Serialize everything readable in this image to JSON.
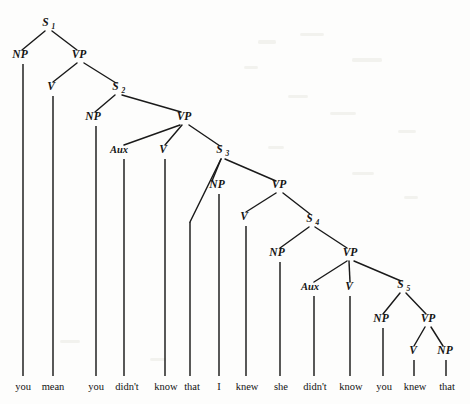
{
  "diagram": {
    "kind": "syntax-tree",
    "sentence": "you mean you didn't know that I knew she didn't know you knew that",
    "background_color": "#fdfdfc",
    "ink_color": "#1a1a1a",
    "width": 470,
    "height": 404
  },
  "nodes": [
    {
      "id": "S1",
      "label": "S",
      "sub": "1",
      "x": 48,
      "y": 26,
      "kind": "clause"
    },
    {
      "id": "NP1",
      "label": "NP",
      "sub": "",
      "x": 20,
      "y": 58,
      "kind": "phrase"
    },
    {
      "id": "VP1",
      "label": "VP",
      "sub": "",
      "x": 79,
      "y": 58,
      "kind": "phrase"
    },
    {
      "id": "V1",
      "label": "V",
      "sub": "",
      "x": 51,
      "y": 90,
      "kind": "head"
    },
    {
      "id": "S2",
      "label": "S",
      "sub": "2",
      "x": 118,
      "y": 90,
      "kind": "clause"
    },
    {
      "id": "NP2",
      "label": "NP",
      "sub": "",
      "x": 93,
      "y": 120,
      "kind": "phrase"
    },
    {
      "id": "VP2",
      "label": "VP",
      "sub": "",
      "x": 184,
      "y": 120,
      "kind": "phrase"
    },
    {
      "id": "AUX1",
      "label": "Aux",
      "sub": "",
      "x": 119,
      "y": 153,
      "kind": "aux"
    },
    {
      "id": "V2",
      "label": "V",
      "sub": "",
      "x": 163,
      "y": 153,
      "kind": "head"
    },
    {
      "id": "S3",
      "label": "S",
      "sub": "3",
      "x": 222,
      "y": 153,
      "kind": "clause"
    },
    {
      "id": "NP3",
      "label": "NP",
      "sub": "",
      "x": 217,
      "y": 188,
      "kind": "phrase"
    },
    {
      "id": "VP3",
      "label": "VP",
      "sub": "",
      "x": 279,
      "y": 188,
      "kind": "phrase"
    },
    {
      "id": "V3",
      "label": "V",
      "sub": "",
      "x": 244,
      "y": 220,
      "kind": "head"
    },
    {
      "id": "S4",
      "label": "S",
      "sub": "4",
      "x": 312,
      "y": 222,
      "kind": "clause"
    },
    {
      "id": "NP4",
      "label": "NP",
      "sub": "",
      "x": 277,
      "y": 256,
      "kind": "phrase"
    },
    {
      "id": "VP4",
      "label": "VP",
      "sub": "",
      "x": 350,
      "y": 256,
      "kind": "phrase"
    },
    {
      "id": "AUX2",
      "label": "Aux",
      "sub": "",
      "x": 310,
      "y": 290,
      "kind": "aux"
    },
    {
      "id": "V4",
      "label": "V",
      "sub": "",
      "x": 349,
      "y": 290,
      "kind": "head"
    },
    {
      "id": "S5",
      "label": "S",
      "sub": "5",
      "x": 403,
      "y": 288,
      "kind": "clause"
    },
    {
      "id": "NP5",
      "label": "NP",
      "sub": "",
      "x": 381,
      "y": 322,
      "kind": "phrase"
    },
    {
      "id": "VP5",
      "label": "VP",
      "sub": "",
      "x": 428,
      "y": 322,
      "kind": "phrase"
    },
    {
      "id": "V5",
      "label": "V",
      "sub": "",
      "x": 413,
      "y": 354,
      "kind": "head"
    },
    {
      "id": "NP6",
      "label": "NP",
      "sub": "",
      "x": 445,
      "y": 354,
      "kind": "phrase"
    }
  ],
  "branches": [
    {
      "from": "S1",
      "to": "NP1",
      "x1": 45,
      "y1": 31,
      "x2": 22,
      "y2": 50
    },
    {
      "from": "S1",
      "to": "VP1",
      "x1": 52,
      "y1": 31,
      "x2": 77,
      "y2": 50
    },
    {
      "from": "VP1",
      "to": "V1",
      "x1": 77,
      "y1": 63,
      "x2": 53,
      "y2": 82
    },
    {
      "from": "VP1",
      "to": "S2",
      "x1": 84,
      "y1": 63,
      "x2": 116,
      "y2": 83
    },
    {
      "from": "S2",
      "to": "NP2",
      "x1": 115,
      "y1": 95,
      "x2": 95,
      "y2": 112
    },
    {
      "from": "S2",
      "to": "VP2",
      "x1": 122,
      "y1": 95,
      "x2": 181,
      "y2": 112
    },
    {
      "from": "VP2",
      "to": "AUX1",
      "x1": 180,
      "y1": 125,
      "x2": 124,
      "y2": 145
    },
    {
      "from": "VP2",
      "to": "V2",
      "x1": 182,
      "y1": 125,
      "x2": 165,
      "y2": 145
    },
    {
      "from": "VP2",
      "to": "S3",
      "x1": 189,
      "y1": 125,
      "x2": 220,
      "y2": 146
    },
    {
      "from": "S3",
      "to": "COMP",
      "x1": 221,
      "y1": 159,
      "x2": 190,
      "y2": 222
    },
    {
      "from": "S3",
      "to": "NP3",
      "x1": 221,
      "y1": 159,
      "x2": 212,
      "y2": 181
    },
    {
      "from": "S3",
      "to": "VP3",
      "x1": 225,
      "y1": 159,
      "x2": 276,
      "y2": 181
    },
    {
      "from": "VP3",
      "to": "V3",
      "x1": 276,
      "y1": 193,
      "x2": 246,
      "y2": 212
    },
    {
      "from": "VP3",
      "to": "S4",
      "x1": 283,
      "y1": 193,
      "x2": 310,
      "y2": 214
    },
    {
      "from": "S4",
      "to": "NP4",
      "x1": 309,
      "y1": 227,
      "x2": 280,
      "y2": 248
    },
    {
      "from": "S4",
      "to": "VP4",
      "x1": 315,
      "y1": 227,
      "x2": 347,
      "y2": 248
    },
    {
      "from": "VP4",
      "to": "AUX2",
      "x1": 347,
      "y1": 261,
      "x2": 314,
      "y2": 282
    },
    {
      "from": "VP4",
      "to": "V4",
      "x1": 349,
      "y1": 261,
      "x2": 350,
      "y2": 282
    },
    {
      "from": "VP4",
      "to": "S5",
      "x1": 354,
      "y1": 261,
      "x2": 401,
      "y2": 281
    },
    {
      "from": "S5",
      "to": "NP5",
      "x1": 400,
      "y1": 293,
      "x2": 383,
      "y2": 314
    },
    {
      "from": "S5",
      "to": "VP5",
      "x1": 406,
      "y1": 293,
      "x2": 426,
      "y2": 314
    },
    {
      "from": "VP5",
      "to": "V5",
      "x1": 425,
      "y1": 327,
      "x2": 414,
      "y2": 346
    },
    {
      "from": "VP5",
      "to": "NP6",
      "x1": 431,
      "y1": 327,
      "x2": 443,
      "y2": 346
    }
  ],
  "stems": [
    {
      "node": "NP1",
      "x": 23,
      "y1": 64,
      "y2": 376
    },
    {
      "node": "V1",
      "x": 53,
      "y1": 96,
      "y2": 376
    },
    {
      "node": "NP2",
      "x": 96,
      "y1": 126,
      "y2": 376
    },
    {
      "node": "AUX1",
      "x": 124,
      "y1": 159,
      "y2": 376
    },
    {
      "node": "V2",
      "x": 165,
      "y1": 159,
      "y2": 376
    },
    {
      "node": "COMP",
      "x": 190,
      "y1": 222,
      "y2": 376
    },
    {
      "node": "NP3",
      "x": 219,
      "y1": 194,
      "y2": 376
    },
    {
      "node": "V3",
      "x": 246,
      "y1": 226,
      "y2": 376
    },
    {
      "node": "NP4",
      "x": 280,
      "y1": 262,
      "y2": 376
    },
    {
      "node": "AUX2",
      "x": 314,
      "y1": 296,
      "y2": 376
    },
    {
      "node": "V4",
      "x": 350,
      "y1": 296,
      "y2": 376
    },
    {
      "node": "NP5",
      "x": 383,
      "y1": 328,
      "y2": 376
    },
    {
      "node": "V5",
      "x": 414,
      "y1": 360,
      "y2": 376
    },
    {
      "node": "NP6",
      "x": 446,
      "y1": 360,
      "y2": 376
    }
  ],
  "leaves": [
    {
      "word": "you",
      "x": 23,
      "y": 390,
      "parent": "NP1"
    },
    {
      "word": "mean",
      "x": 53,
      "y": 390,
      "parent": "V1"
    },
    {
      "word": "you",
      "x": 96,
      "y": 390,
      "parent": "NP2"
    },
    {
      "word": "didn't",
      "x": 127,
      "y": 390,
      "parent": "AUX1"
    },
    {
      "word": "know",
      "x": 166,
      "y": 390,
      "parent": "V2"
    },
    {
      "word": "that",
      "x": 192,
      "y": 390,
      "parent": "COMP"
    },
    {
      "word": "I",
      "x": 219,
      "y": 390,
      "parent": "NP3"
    },
    {
      "word": "knew",
      "x": 247,
      "y": 390,
      "parent": "V3"
    },
    {
      "word": "she",
      "x": 281,
      "y": 390,
      "parent": "NP4"
    },
    {
      "word": "didn't",
      "x": 315,
      "y": 390,
      "parent": "AUX2"
    },
    {
      "word": "know",
      "x": 351,
      "y": 390,
      "parent": "V4"
    },
    {
      "word": "you",
      "x": 384,
      "y": 390,
      "parent": "NP5"
    },
    {
      "word": "knew",
      "x": 415,
      "y": 390,
      "parent": "V5"
    },
    {
      "word": "that",
      "x": 447,
      "y": 390,
      "parent": "NP6"
    }
  ],
  "specks": [
    {
      "x": 258,
      "y": 40,
      "w": 18,
      "h": 4
    },
    {
      "x": 300,
      "y": 33,
      "w": 24,
      "h": 3
    },
    {
      "x": 352,
      "y": 58,
      "w": 30,
      "h": 4
    },
    {
      "x": 244,
      "y": 66,
      "w": 14,
      "h": 3
    },
    {
      "x": 288,
      "y": 95,
      "w": 20,
      "h": 3
    },
    {
      "x": 330,
      "y": 112,
      "w": 26,
      "h": 3
    },
    {
      "x": 398,
      "y": 130,
      "w": 18,
      "h": 3
    },
    {
      "x": 268,
      "y": 146,
      "w": 16,
      "h": 3
    },
    {
      "x": 352,
      "y": 172,
      "w": 22,
      "h": 3
    },
    {
      "x": 404,
      "y": 196,
      "w": 14,
      "h": 3
    },
    {
      "x": 60,
      "y": 340,
      "w": 20,
      "h": 3
    },
    {
      "x": 150,
      "y": 358,
      "w": 16,
      "h": 3
    }
  ]
}
